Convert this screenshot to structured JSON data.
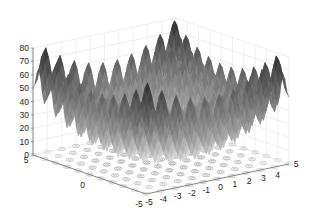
{
  "chart_data": {
    "type": "surface3d",
    "title": "",
    "function": "Rastrigin: z = 20 + x^2 - 10cos(2*pi*x) + y^2 - 10cos(2*pi*y)",
    "colormap": "gray",
    "floor_contour": true,
    "grid": true,
    "x": {
      "label": "",
      "range": [
        -5,
        5
      ],
      "ticks": [
        -5,
        -4,
        -3,
        -2,
        -1,
        0,
        1,
        2,
        3,
        4,
        5
      ]
    },
    "y": {
      "label": "",
      "range": [
        -5,
        5
      ],
      "ticks": [
        5,
        0,
        -5
      ]
    },
    "z": {
      "label": "",
      "range": [
        0,
        80
      ],
      "ticks": [
        0,
        10,
        20,
        30,
        40,
        50,
        60,
        70,
        80
      ]
    },
    "approx_values": {
      "z_min_at_origin": 0,
      "z_max_at_corners": 80,
      "local_extrema_spacing": 1
    }
  }
}
